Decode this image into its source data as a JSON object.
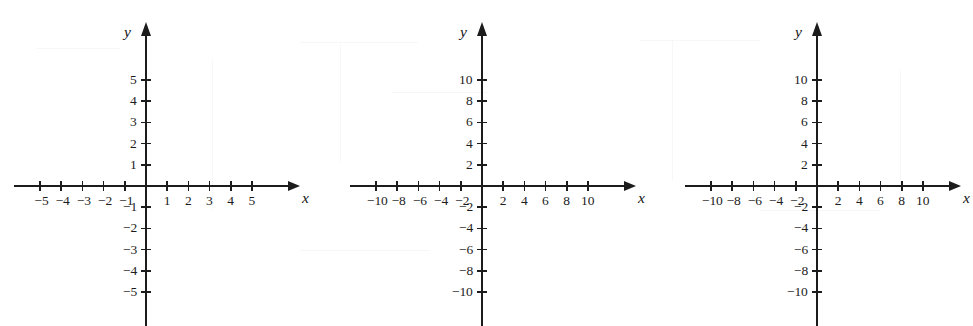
{
  "page": {
    "background_color": "#ffffff",
    "ink_color": "#1c1c1c"
  },
  "chart_data": [
    {
      "id": "graph-1",
      "type": "scatter",
      "title": "",
      "xlabel": "x",
      "ylabel": "y",
      "xlim": [
        -5,
        5
      ],
      "ylim": [
        -5,
        5
      ],
      "grid": false,
      "legend": false,
      "x_ticks": [
        -5,
        -4,
        -3,
        -2,
        -1,
        1,
        2,
        3,
        4,
        5
      ],
      "y_ticks": [
        5,
        4,
        3,
        2,
        1,
        -1,
        -2,
        -3,
        -4,
        -5
      ],
      "x_tick_labels": [
        "−5",
        "−4",
        "−3",
        "−2",
        "−1",
        "1",
        "2",
        "3",
        "4",
        "5"
      ],
      "y_tick_labels": [
        "5",
        "4",
        "3",
        "2",
        "1",
        "−1",
        "−2",
        "−3",
        "−4",
        "−5"
      ],
      "series": [],
      "values": [],
      "origin_px": [
        146,
        186
      ],
      "unit_px": 21.2,
      "arrowheads": [
        "x-positive",
        "y-positive"
      ]
    },
    {
      "id": "graph-2",
      "type": "scatter",
      "title": "",
      "xlabel": "x",
      "ylabel": "y",
      "xlim": [
        -10,
        10
      ],
      "ylim": [
        -10,
        10
      ],
      "grid": false,
      "legend": false,
      "x_ticks": [
        -10,
        -8,
        -6,
        -4,
        -2,
        2,
        4,
        6,
        8,
        10
      ],
      "y_ticks": [
        10,
        8,
        6,
        4,
        2,
        -2,
        -4,
        -6,
        -8,
        -10
      ],
      "x_tick_labels": [
        "−10",
        "−8",
        "−6",
        "−4",
        "−2",
        "2",
        "4",
        "6",
        "8",
        "10"
      ],
      "y_tick_labels": [
        "10",
        "8",
        "6",
        "4",
        "2",
        "−2",
        "−4",
        "−6",
        "−8",
        "−10"
      ],
      "series": [],
      "values": [],
      "origin_px": [
        482,
        186
      ],
      "unit_px": 10.6,
      "arrowheads": [
        "x-positive",
        "y-positive"
      ]
    },
    {
      "id": "graph-3",
      "type": "scatter",
      "title": "",
      "xlabel": "x",
      "ylabel": "y",
      "xlim": [
        -10,
        10
      ],
      "ylim": [
        -10,
        10
      ],
      "grid": false,
      "legend": false,
      "x_ticks": [
        -10,
        -8,
        -6,
        -4,
        -2,
        2,
        4,
        6,
        8,
        10
      ],
      "y_ticks": [
        10,
        8,
        6,
        4,
        2,
        -2,
        -4,
        -6,
        -8,
        -10
      ],
      "x_tick_labels": [
        "−10",
        "−8",
        "−6",
        "−4",
        "−2",
        "2",
        "4",
        "6",
        "8",
        "10"
      ],
      "y_tick_labels": [
        "10",
        "8",
        "6",
        "4",
        "2",
        "−2",
        "−4",
        "−6",
        "−8",
        "−10"
      ],
      "series": [],
      "values": [],
      "origin_px": [
        817,
        186
      ],
      "unit_px": 10.6,
      "arrowheads": [
        "x-positive",
        "y-positive"
      ]
    }
  ]
}
